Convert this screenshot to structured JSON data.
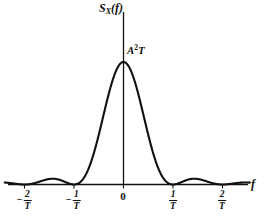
{
  "figure": {
    "kind": "power-spectral-density-plot",
    "background_color": "#ffffff",
    "line_color": "#111111"
  },
  "axes": {
    "y_axis_title": "S",
    "y_axis_title_sub": "X",
    "y_axis_title_arg": "(f)",
    "x_axis_title": "f",
    "peak_label_base": "A",
    "peak_label_exponent": "2",
    "peak_label_tail": "T"
  },
  "ticks": [
    {
      "label_sign": "−",
      "label_num": "2",
      "label_den": "T",
      "value": -2
    },
    {
      "label_sign": "−",
      "label_num": "1",
      "label_den": "T",
      "value": -1
    },
    {
      "label_sign": "",
      "label_num": "0",
      "label_den": "",
      "value": 0
    },
    {
      "label_sign": "",
      "label_num": "1",
      "label_den": "T",
      "value": 1
    },
    {
      "label_sign": "",
      "label_num": "2",
      "label_den": "T",
      "value": 2
    }
  ],
  "chart_data": {
    "type": "line",
    "title": "",
    "subtitle": "",
    "xlabel": "f",
    "ylabel": "S_X(f)",
    "grid": false,
    "legend": null,
    "xlim": [
      -2.4,
      2.55
    ],
    "ylim": [
      0,
      1.18
    ],
    "xticks": [
      -2,
      -1,
      0,
      1,
      2
    ],
    "xticklabels": [
      "-2/T",
      "-1/T",
      "0",
      "1/T",
      "2/T"
    ],
    "yticks": [
      1
    ],
    "yticklabels": [
      "A^2 T"
    ],
    "annotations": [
      {
        "text": "A^2 T",
        "x": 0,
        "y": 1.0,
        "note": "peak amplitude at f = 0"
      }
    ],
    "series": [
      {
        "name": "S_X(f) = A^2 T sinc^2(fT)",
        "formula": "A^2 * T * (sin(pi*f*T)/(pi*f*T))^2",
        "x": [
          -2.4,
          -2.2,
          -2.0,
          -1.8,
          -1.6,
          -1.5,
          -1.4,
          -1.2,
          -1.0,
          -0.9,
          -0.8,
          -0.7,
          -0.6,
          -0.5,
          -0.4,
          -0.3,
          -0.2,
          -0.1,
          0.0,
          0.1,
          0.2,
          0.3,
          0.4,
          0.5,
          0.6,
          0.7,
          0.8,
          0.9,
          1.0,
          1.2,
          1.4,
          1.5,
          1.6,
          1.8,
          2.0,
          2.2,
          2.4
        ],
        "y": [
          0.0118,
          0.0081,
          0.0,
          0.0121,
          0.0299,
          0.045,
          0.0299,
          0.0121,
          0.0,
          0.0109,
          0.0547,
          0.1416,
          0.2546,
          0.4053,
          0.5758,
          0.7368,
          0.8751,
          0.9675,
          1.0,
          0.9675,
          0.8751,
          0.7368,
          0.5758,
          0.4053,
          0.2546,
          0.1416,
          0.0547,
          0.0109,
          0.0,
          0.0121,
          0.0299,
          0.045,
          0.0299,
          0.0121,
          0.0,
          0.0081,
          0.0118
        ]
      }
    ]
  }
}
